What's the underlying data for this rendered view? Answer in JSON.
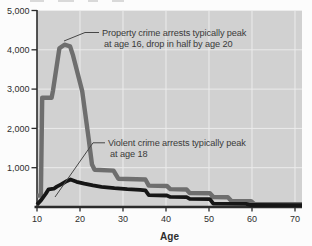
{
  "chart_data": {
    "type": "line",
    "title": "",
    "xlabel": "Age",
    "ylabel": "",
    "xlim": [
      10,
      70
    ],
    "ylim": [
      0,
      5000
    ],
    "grid": true,
    "legend_position": "none",
    "x_ticks": [
      {
        "value": 10,
        "label": "10"
      },
      {
        "value": 20,
        "label": "20"
      },
      {
        "value": 30,
        "label": "30"
      },
      {
        "value": 40,
        "label": "40"
      },
      {
        "value": 50,
        "label": "50"
      },
      {
        "value": 60,
        "label": "60"
      },
      {
        "value": 70,
        "label": "70"
      }
    ],
    "y_ticks": [
      {
        "value": 1000,
        "label": "1,000"
      },
      {
        "value": 2000,
        "label": "2,000"
      },
      {
        "value": 3000,
        "label": "3,000"
      },
      {
        "value": 4000,
        "label": "4,000"
      },
      {
        "value": 5000,
        "label": "5,000"
      }
    ],
    "series": [
      {
        "name": "Property crime arrests",
        "color": "#6e6e6e",
        "stroke_width": 4.4,
        "points": [
          [
            10,
            290
          ],
          [
            10.9,
            290
          ],
          [
            11.2,
            2780
          ],
          [
            13.4,
            2780
          ],
          [
            13.7,
            2950
          ],
          [
            15.2,
            4040
          ],
          [
            16.4,
            4130
          ],
          [
            17.7,
            4090
          ],
          [
            18.4,
            3850
          ],
          [
            20.5,
            2950
          ],
          [
            22,
            1750
          ],
          [
            22.8,
            1080
          ],
          [
            23.4,
            950
          ],
          [
            27.8,
            925
          ],
          [
            28.9,
            720
          ],
          [
            35.2,
            700
          ],
          [
            36,
            545
          ],
          [
            40.2,
            535
          ],
          [
            41,
            455
          ],
          [
            44.8,
            445
          ],
          [
            45.5,
            355
          ],
          [
            50.2,
            350
          ],
          [
            51,
            255
          ],
          [
            54.4,
            250
          ],
          [
            55.2,
            155
          ],
          [
            59.8,
            150
          ],
          [
            60.5,
            80
          ],
          [
            70,
            75
          ]
        ]
      },
      {
        "name": "Violent crime arrests",
        "color": "#161616",
        "stroke_width": 3.8,
        "points": [
          [
            10,
            60
          ],
          [
            11,
            180
          ],
          [
            12,
            330
          ],
          [
            12.7,
            450
          ],
          [
            13.9,
            465
          ],
          [
            14.6,
            520
          ],
          [
            15.6,
            575
          ],
          [
            16.6,
            640
          ],
          [
            17.8,
            700
          ],
          [
            19.2,
            640
          ],
          [
            21,
            595
          ],
          [
            23,
            550
          ],
          [
            25,
            515
          ],
          [
            28,
            478
          ],
          [
            31,
            452
          ],
          [
            34,
            438
          ],
          [
            35.2,
            425
          ],
          [
            36,
            300
          ],
          [
            40.2,
            292
          ],
          [
            41,
            258
          ],
          [
            44.8,
            252
          ],
          [
            45.5,
            208
          ],
          [
            50.2,
            200
          ],
          [
            51,
            85
          ],
          [
            58.6,
            80
          ],
          [
            59.6,
            52
          ],
          [
            70,
            46
          ]
        ]
      }
    ],
    "annotations": [
      {
        "id": "property-crime-annotation",
        "lines": [
          "Property crime arrests typically peak",
          "at age 16, drop in half by age 20"
        ],
        "text_x": 102,
        "text_y": 36,
        "leader": [
          [
            99,
            32.5
          ],
          [
            85,
            32.5
          ],
          [
            64,
            41
          ]
        ]
      },
      {
        "id": "violent-crime-annotation",
        "lines": [
          "Violent crime arrests typically peak",
          "at age 18"
        ],
        "text_x": 108,
        "text_y": 146,
        "leader": [
          [
            105,
            142.8
          ],
          [
            93,
            142.8
          ],
          [
            55,
            197
          ]
        ]
      }
    ]
  },
  "colors": {
    "page_bg": "#fcfcfc",
    "plot_bg": "#d1d1d1",
    "grid": "#ececec",
    "axis": "#2b2b2b",
    "tick_text": "#2e2e2e",
    "annotation_text": "#3a3a3a",
    "leader_line": "#474747"
  }
}
